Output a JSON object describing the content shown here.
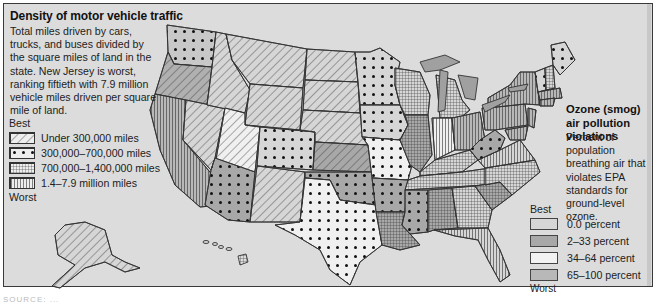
{
  "traffic": {
    "title": "Density of motor vehicle traffic",
    "description": "Total miles driven by cars, trucks, and buses divided by the square miles of land in the state. New Jersey is worst, ranking fiftieth with 7.9 million vehicle miles driven per square mile of land.",
    "best_label": "Best",
    "worst_label": "Worst",
    "legend": [
      {
        "pattern": "diagonal-hatch",
        "label": "Under 300,000 miles"
      },
      {
        "pattern": "dots",
        "label": "300,000–700,000 miles"
      },
      {
        "pattern": "crosshatch-grid",
        "label": "700,000–1,400,000 miles"
      },
      {
        "pattern": "vertical-lines",
        "label": "1.4–7.9 million miles"
      }
    ]
  },
  "ozone": {
    "title": "Ozone (smog) air pollution violations",
    "description": "Percent of population breathing air that violates EPA standards for ground-level ozone.",
    "best_label": "Best",
    "worst_label": "Worst",
    "legend": [
      {
        "color": "#d6d6d6",
        "label": "0.0 percent"
      },
      {
        "color": "#a8a8a8",
        "label": "2–33 percent"
      },
      {
        "color": "#f2f2f2",
        "label": "34–64 percent"
      },
      {
        "color": "#b8b8b8",
        "label": "65–100 percent"
      }
    ]
  },
  "source_line": "SOURCE: ..."
}
